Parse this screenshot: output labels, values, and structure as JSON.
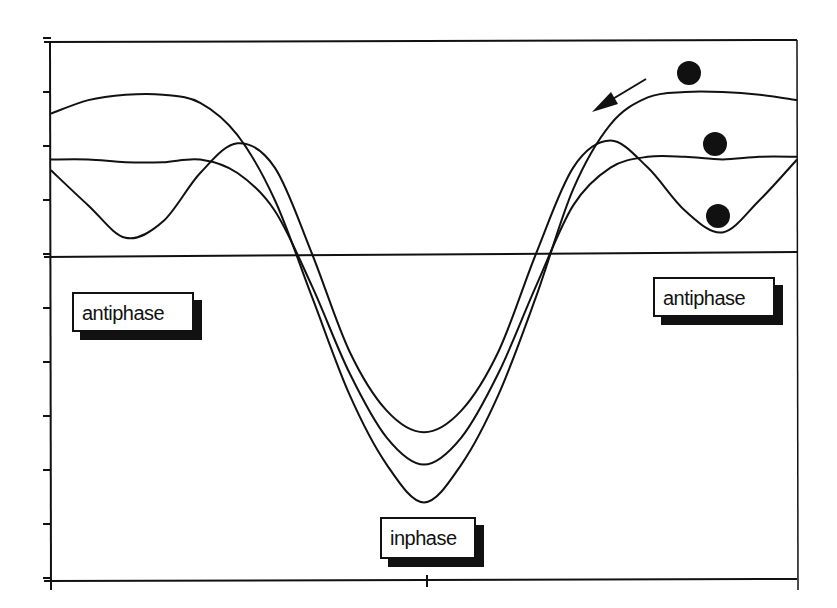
{
  "chart_data": {
    "type": "line",
    "title": "",
    "xlabel": "",
    "ylabel": "",
    "note": "Axes have no numeric tick labels in the image. y-values are inferred from pixel positions and expressed in tick-step units (zero line = 0, one y-tick spacing = 1). x is normalized 0-1 across the plot width. These numbers are estimates, not values read from axis labels.",
    "xlim": [
      0,
      1
    ],
    "ylim": [
      -6,
      4
    ],
    "zero_line": 0,
    "y_ticks_count": 11,
    "x_ticks": [
      0.5
    ],
    "grid": false,
    "legend": null,
    "x": [
      0,
      0.05,
      0.1,
      0.15,
      0.2,
      0.25,
      0.3,
      0.35,
      0.4,
      0.45,
      0.5,
      0.55,
      0.6,
      0.65,
      0.7,
      0.75,
      0.8,
      0.85,
      0.9,
      0.95,
      1.0
    ],
    "series": [
      {
        "name": "curve-high-plateau",
        "values": [
          2.6,
          2.85,
          2.95,
          2.95,
          2.8,
          2.2,
          1.0,
          -0.8,
          -2.6,
          -3.9,
          -4.6,
          -3.9,
          -2.6,
          -0.8,
          1.2,
          2.4,
          2.9,
          3.0,
          3.0,
          2.95,
          2.85
        ]
      },
      {
        "name": "curve-flat-plateau",
        "values": [
          1.75,
          1.75,
          1.7,
          1.7,
          1.75,
          1.5,
          0.8,
          -0.6,
          -2.2,
          -3.4,
          -3.9,
          -3.4,
          -2.2,
          -0.6,
          0.9,
          1.6,
          1.8,
          1.8,
          1.75,
          1.8,
          1.8
        ]
      },
      {
        "name": "curve-oscillating",
        "values": [
          1.55,
          0.9,
          0.3,
          0.6,
          1.5,
          2.05,
          1.6,
          0.0,
          -1.8,
          -2.9,
          -3.3,
          -2.9,
          -1.8,
          0.0,
          1.6,
          2.1,
          1.6,
          0.8,
          0.4,
          1.0,
          1.75
        ]
      }
    ],
    "annotations": [
      {
        "type": "label",
        "text": "antiphase",
        "position": "left, below zero line"
      },
      {
        "type": "label",
        "text": "antiphase",
        "position": "right, below zero line"
      },
      {
        "type": "label",
        "text": "inphase",
        "position": "bottom center"
      },
      {
        "type": "marker",
        "shape": "filled-circle",
        "series": "curve-high-plateau",
        "position": "above right plateau"
      },
      {
        "type": "marker",
        "shape": "filled-circle",
        "series": "curve-flat-plateau",
        "position": "on right plateau"
      },
      {
        "type": "marker",
        "shape": "filled-circle",
        "series": "curve-oscillating",
        "position": "in right trough"
      },
      {
        "type": "arrow",
        "direction": "down-left",
        "position": "upper right, pointing along curves toward the center"
      }
    ]
  },
  "labels": {
    "antiphase_left": "antiphase",
    "antiphase_right": "antiphase",
    "inphase": "inphase"
  },
  "colors": {
    "ink": "#111111",
    "background": "#ffffff"
  }
}
